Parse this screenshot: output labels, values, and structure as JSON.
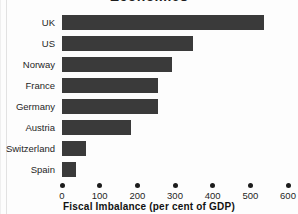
{
  "chart_data": {
    "type": "bar",
    "orientation": "horizontal",
    "title": "Economies",
    "title_cropped": true,
    "xlabel": "Fiscal Imbalance (per cent of GDP)",
    "ylabel": "",
    "categories": [
      "UK",
      "US",
      "Norway",
      "France",
      "Germany",
      "Austria",
      "Switzerland",
      "Spain"
    ],
    "values": [
      536,
      347,
      292,
      255,
      254,
      183,
      64,
      37
    ],
    "xlim": [
      0,
      600
    ],
    "xticks": [
      0,
      100,
      200,
      300,
      400,
      500,
      600
    ],
    "xtick_labels": [
      "0",
      "100",
      "200",
      "300",
      "400",
      "500",
      "600"
    ],
    "grid": false,
    "legend": null,
    "bar_color": "#3a3a3a",
    "background_color": "#fdfdfd",
    "text_color": "#1f1f1f"
  }
}
